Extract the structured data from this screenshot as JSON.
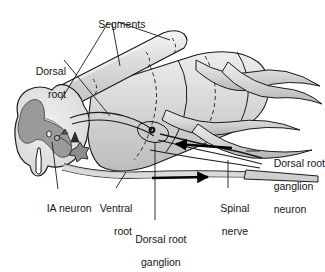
{
  "figure": {
    "type": "anatomical-diagram",
    "background_color": "#ffffff",
    "ink_color": "#1a1a1a",
    "palette": {
      "white_matter": "#e2e2e2",
      "grey_matter": "#9a9a9a",
      "cord_body": "#dcdcdc",
      "cord_body_shade": "#c3c3c3",
      "nerve_fill": "#d6d6d6",
      "dorsal_column": "#d2d2d2",
      "dorsal_column_highlight": "#f2f2f2",
      "outline": "#1a1a1a",
      "arrow": "#000000"
    }
  },
  "labels": {
    "segments": {
      "text": "Segments",
      "align": "center",
      "x": 84,
      "y": 7
    },
    "dorsal_root": {
      "line1": "Dorsal",
      "line2": "root",
      "align": "right",
      "x": 18,
      "y": 54
    },
    "ia_neuron": {
      "text": "IA neuron",
      "align": "left",
      "x": 35,
      "y": 191
    },
    "ventral_root": {
      "line1": "Ventral",
      "line2": "root",
      "align": "right",
      "x": 92,
      "y": 191
    },
    "dorsal_root_ganglion": {
      "line1": "Dorsal root",
      "line2": "ganglion",
      "align": "center",
      "x": 126,
      "y": 222
    },
    "spinal_nerve": {
      "line1": "Spinal",
      "line2": "nerve",
      "align": "center",
      "x": 210,
      "y": 191
    },
    "dorsal_root_ganglion_neuron": {
      "line1": "Dorsal root",
      "line2": "ganglion",
      "line3": "neuron",
      "align": "left",
      "x": 262,
      "y": 146
    }
  },
  "annotations": {
    "arrow_afferent": {
      "name": "afferent-direction-arrow",
      "direction": "left",
      "description": "Sensory signal travelling toward the spinal cord"
    },
    "arrow_efferent": {
      "name": "efferent-direction-arrow",
      "direction": "right",
      "description": "Motor signal travelling away from the spinal cord"
    },
    "leader_count_segments": 3,
    "dashed_segment_boundaries": 3
  },
  "structures": [
    {
      "name": "dorsal-column-cylinder",
      "label": "Dorsal column"
    },
    {
      "name": "spinal-cord-cross-section",
      "label": "Spinal cord cross section"
    },
    {
      "name": "grey-matter",
      "label": "Grey matter (butterfly)"
    },
    {
      "name": "white-matter",
      "label": "White matter"
    },
    {
      "name": "ia-neuron-cell",
      "label": "IA neuron"
    },
    {
      "name": "motor-neuron-cell",
      "label": "Motor neuron cell body"
    },
    {
      "name": "dorsal-root-ganglion-cell",
      "label": "Dorsal root ganglion neuron cell body"
    },
    {
      "name": "dorsal-root-bundle",
      "label": "Dorsal root"
    },
    {
      "name": "ventral-root-bundle",
      "label": "Ventral root"
    },
    {
      "name": "spinal-nerve-bundle",
      "label": "Spinal nerve"
    },
    {
      "name": "cord-body",
      "label": "Spinal cord body"
    }
  ]
}
